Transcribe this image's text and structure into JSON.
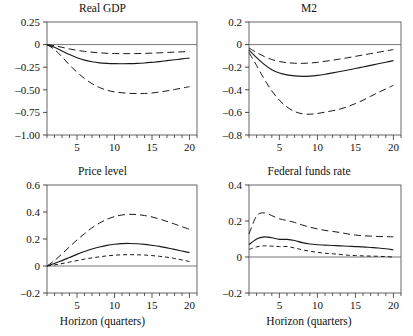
{
  "figure": {
    "xlabel": "Horizon (quarters)",
    "panels": [
      {
        "id": "real-gdp",
        "title": "Real GDP"
      },
      {
        "id": "m2",
        "title": "M2"
      },
      {
        "id": "price-level",
        "title": "Price level"
      },
      {
        "id": "federal-funds-rate",
        "title": "Federal funds rate"
      }
    ]
  },
  "chart_data": [
    {
      "type": "line",
      "title": "Real GDP",
      "xlabel": "Horizon (quarters)",
      "ylabel": "",
      "xlim": [
        1,
        21
      ],
      "ylim": [
        -1.0,
        0.25
      ],
      "xticks": [
        5,
        10,
        15,
        20
      ],
      "xtick_labels": [
        "5",
        "10",
        "15",
        "20"
      ],
      "yticks": [
        0.25,
        0,
        -0.25,
        -0.5,
        -0.75,
        -1.0
      ],
      "ytick_labels": [
        "0.25",
        "0",
        "–0.25",
        "–0.50",
        "–0.75",
        "–1.00"
      ],
      "grid": false,
      "zero_line": true,
      "legend": "none",
      "x": [
        1,
        2,
        3,
        4,
        5,
        6,
        7,
        8,
        9,
        10,
        11,
        12,
        13,
        14,
        15,
        16,
        17,
        18,
        19,
        20
      ],
      "series": [
        {
          "name": "Point estimate",
          "style": "solid",
          "values": [
            0.0,
            -0.03,
            -0.07,
            -0.11,
            -0.145,
            -0.172,
            -0.19,
            -0.202,
            -0.208,
            -0.211,
            -0.212,
            -0.211,
            -0.208,
            -0.203,
            -0.196,
            -0.188,
            -0.178,
            -0.168,
            -0.158,
            -0.15
          ]
        },
        {
          "name": "Upper band",
          "style": "dashed-long",
          "values": [
            0.0,
            -0.012,
            -0.03,
            -0.048,
            -0.063,
            -0.075,
            -0.084,
            -0.091,
            -0.096,
            -0.099,
            -0.1,
            -0.1,
            -0.099,
            -0.097,
            -0.094,
            -0.091,
            -0.087,
            -0.083,
            -0.08,
            -0.078
          ]
        },
        {
          "name": "Lower band",
          "style": "dashed-long",
          "values": [
            0.0,
            -0.055,
            -0.135,
            -0.225,
            -0.305,
            -0.375,
            -0.432,
            -0.475,
            -0.505,
            -0.523,
            -0.533,
            -0.539,
            -0.542,
            -0.541,
            -0.535,
            -0.525,
            -0.512,
            -0.497,
            -0.481,
            -0.465
          ]
        }
      ]
    },
    {
      "type": "line",
      "title": "M2",
      "xlabel": "",
      "ylabel": "",
      "xlim": [
        1,
        21
      ],
      "ylim": [
        -0.8,
        0.2
      ],
      "xticks": [
        5,
        10,
        15,
        20
      ],
      "xtick_labels": [
        "5",
        "10",
        "15",
        "20"
      ],
      "yticks": [
        0.2,
        0,
        -0.2,
        -0.4,
        -0.6,
        -0.8
      ],
      "ytick_labels": [
        "0.2",
        "0",
        "–0.2",
        "–0.4",
        "–0.6",
        "–0.8"
      ],
      "grid": false,
      "zero_line": true,
      "legend": "none",
      "x": [
        1,
        2,
        3,
        4,
        5,
        6,
        7,
        8,
        9,
        10,
        11,
        12,
        13,
        14,
        15,
        16,
        17,
        18,
        19,
        20
      ],
      "series": [
        {
          "name": "Point estimate",
          "style": "solid",
          "values": [
            -0.048,
            -0.115,
            -0.175,
            -0.222,
            -0.252,
            -0.268,
            -0.277,
            -0.281,
            -0.279,
            -0.272,
            -0.262,
            -0.25,
            -0.238,
            -0.225,
            -0.212,
            -0.198,
            -0.184,
            -0.17,
            -0.156,
            -0.142
          ]
        },
        {
          "name": "Upper band",
          "style": "dashed-long",
          "values": [
            -0.03,
            -0.07,
            -0.105,
            -0.132,
            -0.15,
            -0.16,
            -0.165,
            -0.166,
            -0.163,
            -0.157,
            -0.148,
            -0.138,
            -0.127,
            -0.116,
            -0.104,
            -0.092,
            -0.08,
            -0.068,
            -0.056,
            -0.044
          ]
        },
        {
          "name": "Lower band",
          "style": "dashed-long",
          "values": [
            -0.07,
            -0.185,
            -0.305,
            -0.41,
            -0.492,
            -0.552,
            -0.592,
            -0.612,
            -0.616,
            -0.61,
            -0.598,
            -0.585,
            -0.57,
            -0.548,
            -0.522,
            -0.492,
            -0.458,
            -0.424,
            -0.392,
            -0.36
          ]
        }
      ]
    },
    {
      "type": "line",
      "title": "Price level",
      "xlabel": "Horizon (quarters)",
      "ylabel": "",
      "xlim": [
        1,
        21
      ],
      "ylim": [
        -0.2,
        0.6
      ],
      "xticks": [
        5,
        10,
        15,
        20
      ],
      "xtick_labels": [
        "5",
        "10",
        "15",
        "20"
      ],
      "yticks": [
        0.6,
        0.4,
        0.2,
        0,
        -0.2
      ],
      "ytick_labels": [
        "0.6",
        "0.4",
        "0.2",
        "0",
        "–0.2"
      ],
      "grid": false,
      "zero_line": true,
      "legend": "none",
      "x": [
        1,
        2,
        3,
        4,
        5,
        6,
        7,
        8,
        9,
        10,
        11,
        12,
        13,
        14,
        15,
        16,
        17,
        18,
        19,
        20
      ],
      "series": [
        {
          "name": "Point estimate",
          "style": "solid",
          "values": [
            0.0,
            0.018,
            0.04,
            0.063,
            0.086,
            0.107,
            0.126,
            0.141,
            0.153,
            0.161,
            0.166,
            0.167,
            0.165,
            0.16,
            0.153,
            0.145,
            0.134,
            0.123,
            0.111,
            0.099
          ]
        },
        {
          "name": "Upper band",
          "style": "dashed-long",
          "values": [
            0.0,
            0.04,
            0.09,
            0.142,
            0.193,
            0.24,
            0.283,
            0.318,
            0.346,
            0.366,
            0.378,
            0.383,
            0.381,
            0.374,
            0.363,
            0.348,
            0.33,
            0.311,
            0.291,
            0.272
          ]
        },
        {
          "name": "Lower band",
          "style": "dashed-short",
          "values": [
            0.0,
            0.008,
            0.018,
            0.029,
            0.04,
            0.051,
            0.06,
            0.068,
            0.075,
            0.08,
            0.083,
            0.084,
            0.083,
            0.081,
            0.077,
            0.072,
            0.065,
            0.056,
            0.045,
            0.033
          ]
        }
      ]
    },
    {
      "type": "line",
      "title": "Federal funds rate",
      "xlabel": "Horizon (quarters)",
      "ylabel": "",
      "xlim": [
        1,
        21
      ],
      "ylim": [
        -0.2,
        0.4
      ],
      "xticks": [
        5,
        10,
        15,
        20
      ],
      "xtick_labels": [
        "5",
        "10",
        "15",
        "20"
      ],
      "yticks": [
        0.4,
        0.2,
        0,
        -0.2
      ],
      "ytick_labels": [
        "0.4",
        "0.2",
        "0",
        "–0.2"
      ],
      "grid": false,
      "zero_line": true,
      "legend": "none",
      "x": [
        1,
        2,
        3,
        4,
        5,
        6,
        7,
        8,
        9,
        10,
        11,
        12,
        13,
        14,
        15,
        16,
        17,
        18,
        19,
        20
      ],
      "series": [
        {
          "name": "Point estimate",
          "style": "solid",
          "values": [
            0.068,
            0.1,
            0.112,
            0.107,
            0.098,
            0.098,
            0.092,
            0.08,
            0.072,
            0.068,
            0.066,
            0.064,
            0.062,
            0.06,
            0.058,
            0.056,
            0.053,
            0.05,
            0.046,
            0.04
          ]
        },
        {
          "name": "Upper band",
          "style": "dashed-long",
          "values": [
            0.128,
            0.228,
            0.245,
            0.23,
            0.212,
            0.203,
            0.192,
            0.178,
            0.166,
            0.156,
            0.148,
            0.142,
            0.136,
            0.128,
            0.122,
            0.118,
            0.116,
            0.114,
            0.113,
            0.112
          ]
        },
        {
          "name": "Lower band",
          "style": "dashed-short",
          "values": [
            0.042,
            0.056,
            0.062,
            0.06,
            0.058,
            0.058,
            0.05,
            0.04,
            0.032,
            0.026,
            0.021,
            0.018,
            0.014,
            0.01,
            0.008,
            0.006,
            0.005,
            0.004,
            0.002,
            0.0
          ]
        }
      ]
    }
  ]
}
